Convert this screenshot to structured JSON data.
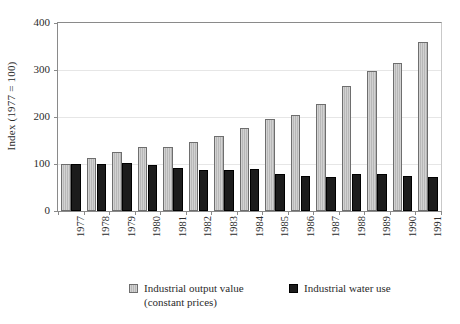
{
  "chart_data": {
    "type": "bar",
    "title": "",
    "subtitle": "",
    "xlabel": "",
    "ylabel": "Index (1977 = 100)",
    "categories": [
      "1977",
      "1978",
      "1979",
      "1980",
      "1981",
      "1982",
      "1983",
      "1984",
      "1985",
      "1986",
      "1987",
      "1988",
      "1989",
      "1990",
      "1991"
    ],
    "series": [
      {
        "name": "Industrial output value",
        "name_line2": "(constant prices)",
        "color": "#bfbfbf",
        "values": [
          100,
          113,
          125,
          136,
          136,
          147,
          160,
          177,
          195,
          205,
          227,
          267,
          298,
          315,
          360
        ]
      },
      {
        "name": "Industrial water use",
        "name_line2": "",
        "color": "#1c1c1c",
        "values": [
          100,
          100,
          103,
          97,
          92,
          88,
          87,
          90,
          78,
          75,
          73,
          79,
          78,
          75,
          73
        ]
      }
    ],
    "ylim": [
      0,
      400
    ],
    "yticks": [
      0,
      100,
      200,
      300,
      400
    ],
    "ytick_labels": [
      "0",
      "100",
      "200",
      "300",
      "400"
    ],
    "grid": true,
    "grid_axis": "y",
    "legend_position": "bottom"
  },
  "legend": {
    "entries": [
      {
        "label": "Industrial output value",
        "label_line2": "(constant prices)"
      },
      {
        "label": "Industrial water use",
        "label_line2": ""
      }
    ]
  }
}
